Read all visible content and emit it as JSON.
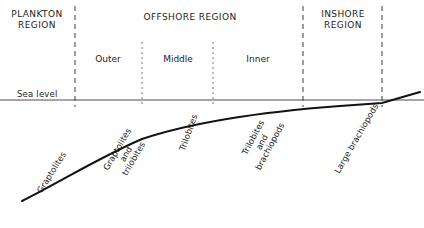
{
  "figure": {
    "type": "diagram",
    "background_color": "#ffffff",
    "line_color": "#1a1a1a",
    "dash_color": "#3a3a3a"
  },
  "regions": [
    {
      "key": "plankton",
      "label": "PLANKTON\nREGION",
      "center_x": 37,
      "top_y": 9
    },
    {
      "key": "offshore",
      "label": "OFFSHORE REGION",
      "center_x": 190,
      "top_y": 12
    },
    {
      "key": "inshore",
      "label": "INSHORE\nREGION",
      "center_x": 342,
      "top_y": 9
    }
  ],
  "subregions": [
    {
      "key": "outer",
      "label": "Outer",
      "center_x": 108,
      "y": 54
    },
    {
      "key": "middle",
      "label": "Middle",
      "center_x": 178,
      "y": 54
    },
    {
      "key": "inner",
      "label": "Inner",
      "center_x": 258,
      "y": 54
    }
  ],
  "sea_level": {
    "label": "Sea level",
    "label_x": 17,
    "label_y": 90,
    "line_y": 100,
    "line_x_start": 0,
    "line_x_end": 424
  },
  "boundaries": [
    {
      "key": "plankton-offshore",
      "x": 75,
      "y_top": 6,
      "y_bottom": 107,
      "style": "major-dashed"
    },
    {
      "key": "outer-middle",
      "x": 142,
      "y_top": 42,
      "y_bottom": 107,
      "style": "fine-dashed"
    },
    {
      "key": "middle-inner",
      "x": 213,
      "y_top": 42,
      "y_bottom": 107,
      "style": "fine-dashed"
    },
    {
      "key": "offshore-inshore",
      "x": 303,
      "y_top": 6,
      "y_bottom": 107,
      "style": "major-dashed"
    },
    {
      "key": "inshore-shore",
      "x": 382,
      "y_top": 6,
      "y_bottom": 107,
      "style": "major-dashed"
    }
  ],
  "seabed": {
    "description": "Sea-floor profile rising from deep offshore to shoreline",
    "path": "M 22,201 C 60,182 100,157 142,139 C 190,123 260,112 340,106 L 382,103 L 420,92",
    "stroke_width": 2
  },
  "fauna_labels": [
    {
      "key": "graptolites",
      "text": "Graptolites",
      "x": 52,
      "y": 180,
      "rotation": -58
    },
    {
      "key": "graptolites-and-trilobites",
      "text": "Graptolites\nand\ntrilobites",
      "x": 126,
      "y": 152,
      "rotation": -60
    },
    {
      "key": "trilobites",
      "text": "Trilobites",
      "x": 189,
      "y": 140,
      "rotation": -70
    },
    {
      "key": "trilobites-and-brachiopods",
      "text": "Trilobites\nand\nbrachiopods",
      "x": 262,
      "y": 140,
      "rotation": -62
    },
    {
      "key": "large-brachiopods",
      "text": "Large brachiopods",
      "x": 357,
      "y": 146,
      "rotation": -60
    }
  ]
}
